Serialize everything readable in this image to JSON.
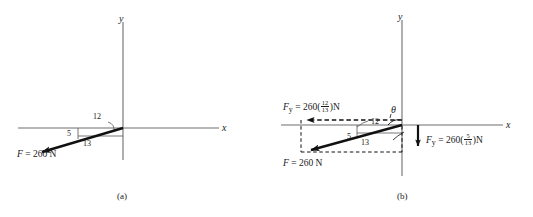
{
  "figure": {
    "width": 533,
    "height": 217,
    "background": "#ffffff",
    "ink_color": "#1a1a1a",
    "axis_color": "#6e6e6e"
  },
  "panel_a": {
    "caption": "(a)",
    "axis_x_label": "x",
    "axis_y_label": "y",
    "triangle": {
      "run_label": "12",
      "rise_label": "5",
      "hypotenuse_label": "13"
    },
    "force_label": {
      "symbol": "F",
      "equals": " = ",
      "magnitude": "260",
      "unit": "N",
      "full": "F = 260 N"
    }
  },
  "panel_b": {
    "caption": "(b)",
    "axis_x_label": "x",
    "axis_y_label": "y",
    "angle_symbol": "θ",
    "triangle": {
      "run_label": "12",
      "rise_label": "5",
      "hypotenuse_label": "13"
    },
    "force_label": {
      "symbol": "F",
      "equals": " = ",
      "magnitude": "260",
      "unit": "N",
      "full": "F = 260 N"
    },
    "component_x": {
      "symbol": "F",
      "subscript": "y",
      "equals": " = ",
      "coefficient": "260(",
      "numerator": "12",
      "denominator": "13",
      "close": ")N",
      "full": "F_y = 260(12/13)N",
      "direction": "left"
    },
    "component_y": {
      "symbol": "F",
      "subscript": "y",
      "equals": " = ",
      "coefficient": "260(",
      "numerator": "5",
      "denominator": "13",
      "close": ")N",
      "full": "F_y = 260(5/13)N",
      "direction": "down"
    }
  }
}
